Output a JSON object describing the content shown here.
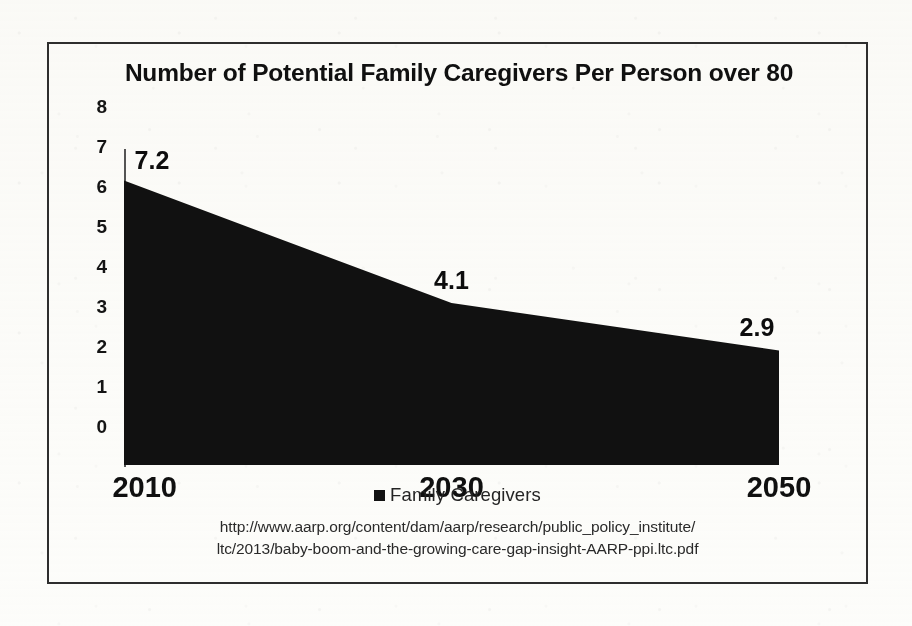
{
  "chart_data": {
    "type": "area",
    "title": "Number of Potential Family Caregivers Per Person over 80",
    "categories": [
      "2010",
      "2030",
      "2050"
    ],
    "values": [
      7.2,
      4.1,
      2.9
    ],
    "point_labels": [
      "7.2",
      "4.1",
      "2.9"
    ],
    "series": [
      {
        "name": "Family Caregivers",
        "values": [
          7.2,
          4.1,
          2.9
        ],
        "color": "#111111"
      }
    ],
    "xlabel": "",
    "ylabel": "",
    "ylim": [
      0,
      8
    ],
    "yticks": [
      "8",
      "7",
      "6",
      "5",
      "4",
      "3",
      "2",
      "1",
      "0"
    ],
    "ytick_values": [
      8,
      7,
      6,
      5,
      4,
      3,
      2,
      1,
      0
    ],
    "grid": false,
    "legend_position": "bottom",
    "legend": [
      {
        "label": "Family Caregivers",
        "marker": "square",
        "color": "#121212"
      }
    ]
  },
  "source": {
    "line1": "http://www.aarp.org/content/dam/aarp/research/public_policy_institute/",
    "line2": "ltc/2013/baby-boom-and-the-growing-care-gap-insight-AARP-ppi.ltc.pdf"
  },
  "colors": {
    "area_fill": "#111111",
    "frame_border": "#2e2e2e",
    "page_background": "#fdfdfb",
    "text": "#101010"
  }
}
